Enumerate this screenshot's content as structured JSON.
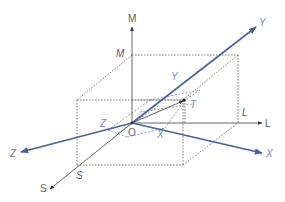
{
  "diagram": {
    "colors": {
      "rotated_axes": "#4a5f9c",
      "original_axes": "#555555",
      "dashed": "#666666",
      "label": "#555a66",
      "rotated_label": "#7a86a8"
    },
    "origin": {
      "label": "O"
    },
    "original_axes": {
      "m": {
        "label": "M",
        "projection_label": "M"
      },
      "l": {
        "label": "L",
        "projection_label": "L"
      },
      "s": {
        "label": "S",
        "projection_label": "S"
      }
    },
    "rotated_axes": {
      "y": {
        "label": "Y",
        "projection_label": "Y"
      },
      "x": {
        "label": "X",
        "projection_label": "X"
      },
      "z": {
        "label": "Z",
        "projection_label": "Z"
      }
    },
    "point": {
      "label": "T"
    }
  }
}
